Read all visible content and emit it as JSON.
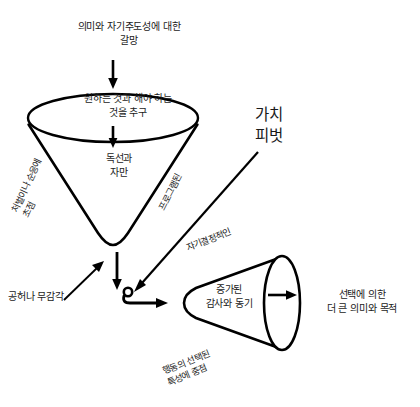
{
  "diagram": {
    "title_concept": "가치 피벗",
    "language": "ko",
    "stroke_color": "#000000",
    "text_color": "#1a1a1a",
    "background": "#ffffff"
  },
  "labels": {
    "craving": "의미와 자기주도성에 대한\n갈망",
    "pursuit": "원하는 것과 해야 하는\n것을 추구",
    "dogmatism": "독선과\n자만",
    "punishment_focus": "처벌이나 순응에\n초점",
    "programmed": "프로그램된",
    "value_pivot": "가치\n피벗",
    "self_determined": "자기결정적인",
    "emptiness": "공허나 무감각",
    "gratitude": "증가된\n감사와 동기",
    "behaviour_focus": "행동의 선택된\n특성에 중점",
    "meaning": "선택에 의한\n더 큰 의미와 목적"
  },
  "shapes": {
    "left_funnel": "inverted-cone-with-elliptical-rim",
    "right_cone": "horizontal-cone-with-elliptical-mouth",
    "pivot_point": "small-circle"
  },
  "arrows": {
    "craving_to_funnel": "down-arrow",
    "pursuit_to_dogmatism": "down-arrow",
    "funnel_to_pivot": "down-arrow",
    "emptiness_to_funnel": "diagonal-up-right-arrow",
    "pivot_to_cone": "right-arrow",
    "value_pivot_to_point": "diagonal-down-left-arrow",
    "cone_to_meaning": "right-arrow"
  }
}
